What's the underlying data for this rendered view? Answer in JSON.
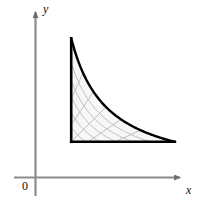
{
  "figure": {
    "caption_type": "math-region-plot",
    "origin_label": "0",
    "x_axis_label": "x",
    "y_axis_label": "y",
    "colors": {
      "background": "#ffffff",
      "region_fill": "#f7f7f7",
      "grid_line": "#b9b9b9",
      "boundary_curve": "#000000",
      "axis_line": "#808080",
      "text": "#111111"
    }
  },
  "chart_data": {
    "type": "line",
    "title": "",
    "xlabel": "x",
    "ylabel": "y",
    "grid": true,
    "legend": null,
    "xlim": [
      0,
      4.6
    ],
    "ylim": [
      0,
      4.6
    ],
    "annotations": [
      {
        "text": "0",
        "x": 0,
        "y": 0,
        "placement": "below-left-of-origin"
      },
      {
        "text": "x",
        "x": 4.55,
        "y": 0,
        "placement": "right-axis-tip"
      },
      {
        "text": "y",
        "x": 0,
        "y": 4.55,
        "placement": "above-axis-tip"
      }
    ],
    "series": [
      {
        "name": "boundary-hyperbola",
        "equation": "x*y = 4.3",
        "style": "solid-bold",
        "color": "#000000",
        "x": [
          1.05,
          1.2,
          1.4,
          1.6,
          1.9,
          2.2,
          2.6,
          3.0,
          3.4,
          3.8,
          4.1
        ],
        "y": [
          4.1,
          3.58,
          3.07,
          2.69,
          2.26,
          1.95,
          1.65,
          1.43,
          1.26,
          1.13,
          1.05
        ]
      },
      {
        "name": "left-boundary-y-axis",
        "equation": "x = 1.05",
        "style": "solid-bold",
        "color": "#000000",
        "x": [
          1.05,
          1.05
        ],
        "y": [
          0,
          4.1
        ]
      },
      {
        "name": "bottom-boundary-x-axis",
        "equation": "y = 1.05",
        "style": "solid-bold",
        "color": "#000000",
        "x": [
          1.05,
          4.1
        ],
        "y": [
          1.05,
          1.05
        ]
      }
    ],
    "grid_families": [
      {
        "name": "hyperbolas",
        "equation": "x*y = k",
        "k_values": [
          1.15,
          1.55,
          2.0,
          2.5,
          3.0,
          3.55,
          4.3
        ],
        "color": "#b9b9b9"
      },
      {
        "name": "rays",
        "equation": "y = m*x",
        "m_values": [
          0.28,
          0.45,
          0.68,
          1.0,
          1.48,
          2.2,
          3.6
        ],
        "color": "#b9b9b9"
      }
    ]
  }
}
